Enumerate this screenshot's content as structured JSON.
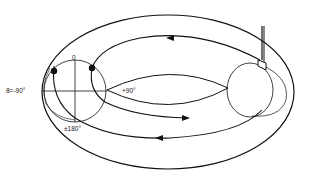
{
  "diagram": {
    "type": "torus field-line diagram",
    "labels": {
      "top": "0",
      "left": "θ=-90°",
      "right": "+90°",
      "bottom": "±180°"
    },
    "elements": [
      "outer torus ellipse",
      "inner torus hole",
      "left poloidal cross-section circle",
      "right poloidal cross-section circle",
      "probe inserted from top right",
      "two marker dots on left cross-section",
      "field lines with direction arrows"
    ],
    "colors": {
      "line": "#111111",
      "background": "#ffffff"
    }
  }
}
